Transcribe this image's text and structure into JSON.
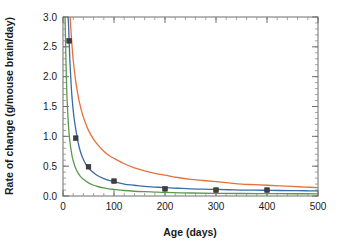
{
  "chart_data": {
    "type": "line",
    "title": "",
    "xlabel": "Age (days)",
    "ylabel": "Rate of change (g/mouse brain/day)",
    "xlim": [
      0,
      500
    ],
    "ylim": [
      0.0,
      3.0
    ],
    "x_ticks": [
      0,
      100,
      200,
      300,
      400,
      500
    ],
    "x_tick_labels": [
      "0",
      "100",
      "200",
      "300",
      "400",
      "500"
    ],
    "x_minor_step": 20,
    "y_ticks": [
      0.0,
      0.5,
      1.0,
      1.5,
      2.0,
      2.5,
      3.0
    ],
    "y_tick_labels": [
      "0.0",
      "0.5",
      "1.0",
      "1.5",
      "2.0",
      "2.5",
      "3.0"
    ],
    "y_minor_step": 0.1,
    "grid": false,
    "legend": "none",
    "tick_direction": "in",
    "frame": "full-box",
    "series": [
      {
        "name": "upper-curve",
        "color": "#e8703a",
        "style": "line",
        "x": [
          14,
          16,
          18,
          20,
          25,
          30,
          35,
          40,
          50,
          60,
          70,
          80,
          90,
          100,
          120,
          140,
          160,
          180,
          200,
          225,
          250,
          275,
          300,
          325,
          350,
          375,
          400,
          425,
          450,
          475,
          500
        ],
        "y": [
          3.0,
          2.72,
          2.48,
          2.28,
          1.92,
          1.66,
          1.47,
          1.32,
          1.1,
          0.95,
          0.84,
          0.75,
          0.68,
          0.63,
          0.54,
          0.47,
          0.42,
          0.38,
          0.35,
          0.31,
          0.28,
          0.26,
          0.24,
          0.22,
          0.2,
          0.19,
          0.18,
          0.17,
          0.16,
          0.15,
          0.14
        ]
      },
      {
        "name": "middle-curve",
        "color": "#3b6aa8",
        "style": "line-with-markers",
        "x": [
          10,
          11,
          12,
          14,
          16,
          18,
          20,
          22,
          25,
          30,
          35,
          40,
          45,
          50,
          60,
          70,
          80,
          90,
          100,
          120,
          140,
          160,
          180,
          200,
          225,
          250,
          275,
          300,
          325,
          350,
          375,
          400,
          425,
          450,
          475,
          500
        ],
        "y": [
          3.0,
          2.85,
          2.6,
          2.18,
          1.86,
          1.62,
          1.44,
          1.29,
          1.12,
          0.88,
          0.72,
          0.61,
          0.53,
          0.47,
          0.39,
          0.33,
          0.29,
          0.26,
          0.24,
          0.2,
          0.18,
          0.16,
          0.15,
          0.14,
          0.13,
          0.12,
          0.115,
          0.11,
          0.105,
          0.1,
          0.098,
          0.095,
          0.092,
          0.09,
          0.088,
          0.085
        ]
      },
      {
        "name": "lower-curve",
        "color": "#5a9a4e",
        "style": "line",
        "x": [
          4,
          5,
          6,
          7,
          8,
          10,
          12,
          14,
          16,
          18,
          20,
          25,
          30,
          35,
          40,
          50,
          60,
          70,
          80,
          90,
          100,
          120,
          140,
          160,
          180,
          200,
          250,
          300,
          350,
          400,
          450,
          500
        ],
        "y": [
          3.0,
          2.6,
          2.2,
          1.88,
          1.62,
          1.28,
          1.04,
          0.88,
          0.76,
          0.66,
          0.59,
          0.46,
          0.38,
          0.32,
          0.28,
          0.22,
          0.18,
          0.155,
          0.135,
          0.12,
          0.11,
          0.092,
          0.08,
          0.072,
          0.066,
          0.06,
          0.05,
          0.045,
          0.042,
          0.04,
          0.038,
          0.036
        ]
      }
    ],
    "data_points": {
      "name": "observed-points",
      "color": "#3f3f3f",
      "marker": "square",
      "x": [
        12,
        25,
        50,
        100,
        200,
        300,
        400
      ],
      "y": [
        2.6,
        0.97,
        0.49,
        0.25,
        0.12,
        0.1,
        0.1
      ]
    }
  }
}
